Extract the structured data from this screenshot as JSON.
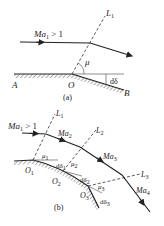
{
  "figure_a": {
    "caption": "(a)",
    "flow_label": "Ma",
    "flow_sub": "1",
    "flow_cond": " > 1",
    "mach_line_label": "L",
    "mach_line_sub": "1",
    "angle_label": "μ",
    "deflection_label": "dδ",
    "point_labels": {
      "A": "A",
      "O": "O",
      "B": "B"
    }
  },
  "figure_b": {
    "caption": "(b)",
    "inflow_label": "Ma",
    "inflow_sub": "1",
    "inflow_cond": " > 1",
    "mach_numbers": [
      {
        "label": "Ma",
        "sub": "2"
      },
      {
        "label": "Ma",
        "sub": "3"
      },
      {
        "label": "Ma",
        "sub": "4"
      }
    ],
    "mach_lines": [
      {
        "label": "L",
        "sub": "1"
      },
      {
        "label": "L",
        "sub": "2"
      },
      {
        "label": "L",
        "sub": "3"
      }
    ],
    "angles": [
      {
        "label": "μ",
        "sub": "1"
      },
      {
        "label": "μ",
        "sub": "2"
      },
      {
        "label": "μ",
        "sub": "3"
      }
    ],
    "deflections": [
      {
        "label": "dδ",
        "sub": "1"
      },
      {
        "label": "dδ",
        "sub": "2"
      },
      {
        "label": "dδ",
        "sub": "3"
      }
    ],
    "points": [
      {
        "label": "O",
        "sub": "1"
      },
      {
        "label": "O",
        "sub": "2"
      },
      {
        "label": "O",
        "sub": "3"
      }
    ]
  }
}
